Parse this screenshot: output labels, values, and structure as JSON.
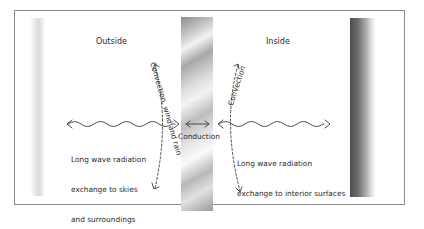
{
  "diagram": {
    "zones": {
      "outside": "Outside",
      "inside": "Inside"
    },
    "labels": {
      "conduction": "Conduction",
      "convection_outside": "Convection, wind and rain",
      "convection_inside": "Convection",
      "radiation_outside_line1": "Long wave radiation",
      "radiation_outside_line2": "exchange to skies",
      "radiation_outside_line3": "and surroundings",
      "radiation_inside_line1": "Long wave radiation",
      "radiation_inside_line2": "exchange to interior surfaces"
    },
    "elements": {
      "outside_surface": "light-gradient-strip",
      "wall": "metallic-wall-section",
      "inside_surface": "dark-gradient-strip"
    },
    "colors": {
      "frame": "#8a8a8a",
      "text": "#2a2a2a",
      "arrow": "#3a3a3a"
    }
  }
}
